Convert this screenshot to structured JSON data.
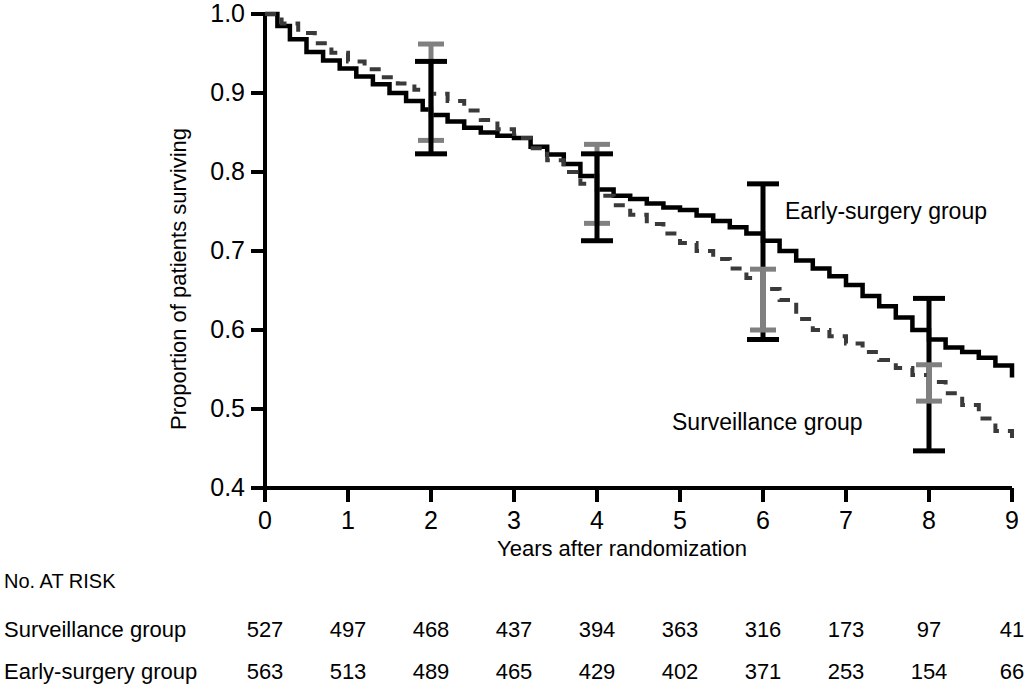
{
  "chart_data": {
    "type": "line",
    "title": "",
    "xlabel": "Years after randomization",
    "ylabel": "Proportion of patients surviving",
    "xlim": [
      0,
      9
    ],
    "ylim": [
      0.4,
      1.0
    ],
    "xticks": [
      0,
      1,
      2,
      3,
      4,
      5,
      6,
      7,
      8,
      9
    ],
    "xtick_labels": [
      "0",
      "1",
      "2",
      "3",
      "4",
      "5",
      "6",
      "7",
      "8",
      "9"
    ],
    "yticks": [
      0.4,
      0.5,
      0.6,
      0.7,
      0.8,
      0.9,
      1.0
    ],
    "ytick_labels": [
      "0.4",
      "0.5",
      "0.6",
      "0.7",
      "0.8",
      "0.9",
      "1.0"
    ],
    "grid": false,
    "legend_position": "inline-annotation",
    "series": [
      {
        "name": "Early-surgery group",
        "style": "solid",
        "color": "#000000",
        "annotation": "Early-surgery group",
        "x": [
          0,
          0.15,
          0.3,
          0.5,
          0.7,
          0.9,
          1.1,
          1.3,
          1.5,
          1.7,
          1.9,
          2.0,
          2.2,
          2.4,
          2.6,
          2.8,
          3.0,
          3.2,
          3.4,
          3.6,
          3.8,
          4.0,
          4.2,
          4.4,
          4.6,
          4.8,
          5.0,
          5.2,
          5.4,
          5.6,
          5.8,
          6.0,
          6.2,
          6.4,
          6.6,
          6.8,
          7.0,
          7.2,
          7.4,
          7.6,
          7.8,
          8.0,
          8.2,
          8.4,
          8.6,
          8.8,
          9.0
        ],
        "y": [
          1.0,
          0.985,
          0.968,
          0.952,
          0.941,
          0.931,
          0.921,
          0.911,
          0.9,
          0.89,
          0.879,
          0.872,
          0.864,
          0.856,
          0.85,
          0.846,
          0.843,
          0.832,
          0.822,
          0.81,
          0.795,
          0.778,
          0.77,
          0.766,
          0.76,
          0.755,
          0.752,
          0.745,
          0.738,
          0.73,
          0.722,
          0.713,
          0.7,
          0.688,
          0.678,
          0.668,
          0.657,
          0.643,
          0.63,
          0.616,
          0.6,
          0.588,
          0.578,
          0.572,
          0.565,
          0.555,
          0.54
        ]
      },
      {
        "name": "Surveillance group",
        "style": "dashed",
        "color": "#3a3a3a",
        "annotation": "Surveillance group",
        "x": [
          0,
          0.2,
          0.4,
          0.6,
          0.8,
          1.0,
          1.2,
          1.4,
          1.6,
          1.8,
          2.0,
          2.2,
          2.4,
          2.6,
          2.8,
          3.0,
          3.2,
          3.4,
          3.6,
          3.8,
          4.0,
          4.2,
          4.4,
          4.6,
          4.8,
          5.0,
          5.2,
          5.4,
          5.6,
          5.8,
          6.0,
          6.2,
          6.4,
          6.6,
          6.8,
          7.0,
          7.2,
          7.4,
          7.6,
          7.8,
          8.0,
          8.2,
          8.4,
          8.6,
          8.8,
          9.0
        ],
        "y": [
          1.0,
          0.988,
          0.976,
          0.963,
          0.951,
          0.94,
          0.93,
          0.92,
          0.912,
          0.904,
          0.899,
          0.89,
          0.878,
          0.866,
          0.854,
          0.843,
          0.83,
          0.815,
          0.8,
          0.785,
          0.77,
          0.758,
          0.746,
          0.734,
          0.722,
          0.71,
          0.7,
          0.69,
          0.678,
          0.666,
          0.652,
          0.638,
          0.614,
          0.6,
          0.592,
          0.583,
          0.572,
          0.562,
          0.552,
          0.543,
          0.534,
          0.52,
          0.505,
          0.488,
          0.472,
          0.463
        ]
      }
    ],
    "error_bars": [
      {
        "series": "Surveillance group",
        "color": "#808080",
        "x": 2,
        "y": 0.9,
        "low": 0.84,
        "high": 0.962
      },
      {
        "series": "Early-surgery group",
        "color": "#000000",
        "x": 2,
        "y": 0.872,
        "low": 0.823,
        "high": 0.94
      },
      {
        "series": "Surveillance group",
        "color": "#808080",
        "x": 4,
        "y": 0.77,
        "low": 0.735,
        "high": 0.835
      },
      {
        "series": "Early-surgery group",
        "color": "#000000",
        "x": 4,
        "y": 0.778,
        "low": 0.713,
        "high": 0.823
      },
      {
        "series": "Early-surgery group",
        "color": "#000000",
        "x": 6,
        "y": 0.713,
        "low": 0.588,
        "high": 0.785
      },
      {
        "series": "Surveillance group",
        "color": "#808080",
        "x": 6,
        "y": 0.638,
        "low": 0.6,
        "high": 0.677
      },
      {
        "series": "Early-surgery group",
        "color": "#000000",
        "x": 8,
        "y": 0.588,
        "low": 0.447,
        "high": 0.64
      },
      {
        "series": "Surveillance group",
        "color": "#808080",
        "x": 8,
        "y": 0.534,
        "low": 0.51,
        "high": 0.556
      }
    ]
  },
  "risk_table": {
    "header": "No. AT RISK",
    "columns": [
      "0",
      "1",
      "2",
      "3",
      "4",
      "5",
      "6",
      "7",
      "8",
      "9"
    ],
    "rows": [
      {
        "label": "Surveillance group",
        "values": [
          "527",
          "497",
          "468",
          "437",
          "394",
          "363",
          "316",
          "173",
          "97",
          "41"
        ]
      },
      {
        "label": "Early-surgery group",
        "values": [
          "563",
          "513",
          "489",
          "465",
          "429",
          "402",
          "371",
          "253",
          "154",
          "66"
        ]
      }
    ]
  }
}
